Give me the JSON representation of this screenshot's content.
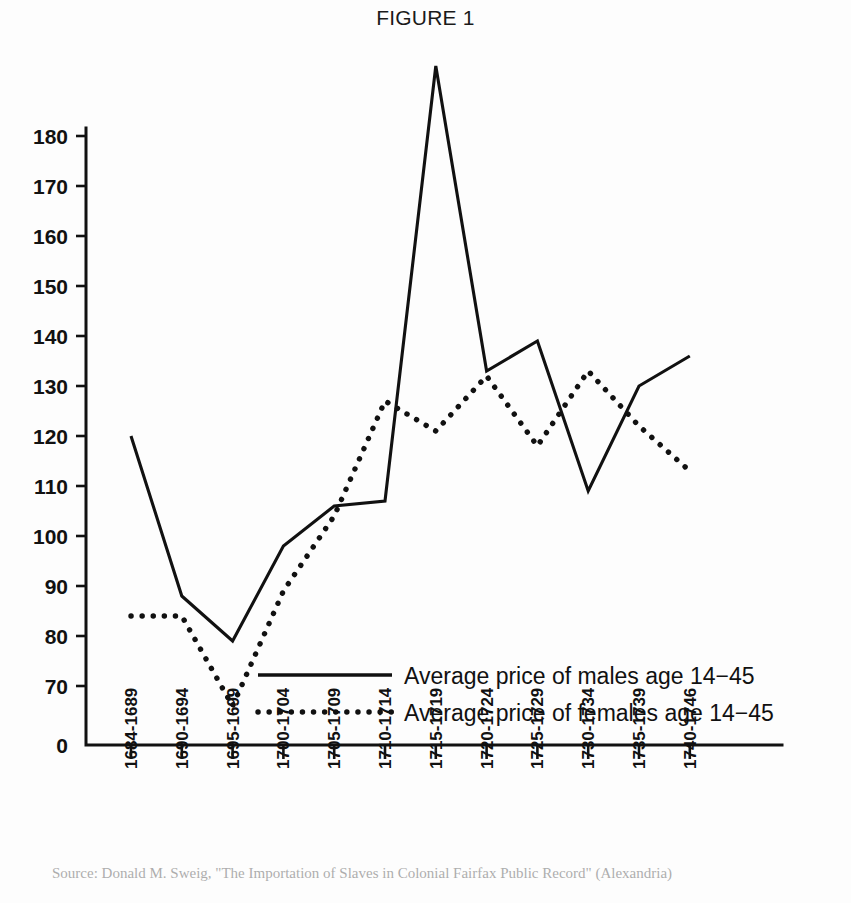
{
  "figure": {
    "title": "FIGURE 1"
  },
  "legend": {
    "position": "inside-lower-center",
    "items": [
      {
        "label": "Average price of males age 14−45",
        "style": "solid"
      },
      {
        "label": "Average price of females age 14−45",
        "style": "dotted"
      }
    ]
  },
  "axes": {
    "y_tick_labels": [
      "180",
      "170",
      "160",
      "150",
      "140",
      "130",
      "120",
      "110",
      "100",
      "90",
      "80",
      "70"
    ],
    "y_origin_label": "0",
    "x_tick_labels": [
      "1684-1689",
      "1690-1694",
      "1695-1699",
      "1700-1704",
      "1705-1709",
      "1710-1714",
      "1715-1719",
      "1720-1724",
      "1725-1729",
      "1730-1734",
      "1735-1739",
      "1740-1746"
    ]
  },
  "colors": {
    "ink": "#111111",
    "paper": "#fdfdfd"
  },
  "chart_data": {
    "type": "line",
    "title": "FIGURE 1",
    "xlabel": "",
    "ylabel": "",
    "grid": false,
    "legend_position": "inside-lower-center",
    "ylim": [
      70,
      180
    ],
    "y_ticks": [
      70,
      80,
      90,
      100,
      110,
      120,
      130,
      140,
      150,
      160,
      170,
      180
    ],
    "y_axis_note": "Axis has a break between 0 and 70; 0 is drawn at the origin.",
    "categories": [
      "1684-1689",
      "1690-1694",
      "1695-1699",
      "1700-1704",
      "1705-1709",
      "1710-1714",
      "1715-1719",
      "1720-1724",
      "1725-1729",
      "1730-1734",
      "1735-1739",
      "1740-1746"
    ],
    "series": [
      {
        "name": "Average price of males age 14−45",
        "style": "solid",
        "x": [
          "1684-1689",
          "1690-1694",
          "1695-1699",
          "1700-1704",
          "1705-1709",
          "1710-1714",
          "1715-1719",
          "1720-1724",
          "1725-1729",
          "1730-1734",
          "1735-1739",
          "1740-1746"
        ],
        "values": [
          120,
          88,
          79,
          98,
          106,
          107,
          194,
          133,
          139,
          109,
          130,
          136
        ]
      },
      {
        "name": "Average price of females age 14−45",
        "style": "dotted",
        "x": [
          "1684-1689",
          "1690-1694",
          "1695-1699",
          "1700-1704",
          "1705-1709",
          "1710-1714",
          "1715-1719",
          "1720-1724",
          "1725-1729",
          "1730-1734",
          "1735-1739",
          "1740-1746"
        ],
        "values": [
          84,
          84,
          66,
          89,
          104,
          127,
          121,
          132,
          118,
          133,
          122,
          113
        ],
        "extra_points": [
          {
            "after_index": 0,
            "note": "flat segment between first two periods at 84"
          }
        ]
      }
    ]
  },
  "caption": {
    "text": "Source: Donald M. Sweig, \"The Importation of Slaves in Colonial Fairfax Public Record\" (Alexandria)"
  }
}
